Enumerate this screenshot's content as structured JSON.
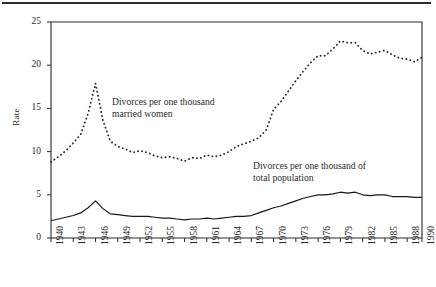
{
  "figure": {
    "ylabel": "Rate",
    "annotations": {
      "married_women": "Divorces per one thousand\nmarried women",
      "total_population": "Divorces per one thousand of\ntotal population"
    },
    "colors": {
      "axis": "#2b2b2b",
      "line": "#1a1a1a",
      "dotted": "#2b2b2b",
      "background": "#ffffff"
    }
  },
  "chart_data": {
    "type": "line",
    "title": "",
    "xlabel": "",
    "ylabel": "Rate",
    "xlim": [
      1940,
      1990
    ],
    "ylim": [
      0,
      25
    ],
    "grid": false,
    "legend_position": "inline-annotations",
    "yticks": [
      0,
      5,
      10,
      15,
      20,
      25
    ],
    "ytick_labels": [
      "0",
      "5",
      "10",
      "15",
      "20",
      "25"
    ],
    "xticks": [
      1940,
      1943,
      1946,
      1949,
      1952,
      1955,
      1958,
      1961,
      1964,
      1967,
      1970,
      1973,
      1976,
      1979,
      1982,
      1985,
      1988,
      1990
    ],
    "xtick_labels": [
      "1940",
      "1943",
      "1946",
      "1949",
      "1952",
      "1955",
      "1958",
      "1961",
      "1964",
      "1967",
      "1970",
      "1973",
      "1976",
      "1979",
      "1982",
      "1985",
      "1988",
      "1990"
    ],
    "x": [
      1940,
      1941,
      1942,
      1943,
      1944,
      1945,
      1946,
      1947,
      1948,
      1949,
      1950,
      1951,
      1952,
      1953,
      1954,
      1955,
      1956,
      1957,
      1958,
      1959,
      1960,
      1961,
      1962,
      1963,
      1964,
      1965,
      1966,
      1967,
      1968,
      1969,
      1970,
      1971,
      1972,
      1973,
      1974,
      1975,
      1976,
      1977,
      1978,
      1979,
      1980,
      1981,
      1982,
      1983,
      1984,
      1985,
      1986,
      1987,
      1988,
      1989,
      1990
    ],
    "series": [
      {
        "name": "Divorces per one thousand married women",
        "style": "dotted",
        "values": [
          8.8,
          9.4,
          10.1,
          11.0,
          12.0,
          14.4,
          17.9,
          13.6,
          11.2,
          10.6,
          10.3,
          9.9,
          10.1,
          9.9,
          9.5,
          9.3,
          9.4,
          9.2,
          8.9,
          9.3,
          9.2,
          9.6,
          9.4,
          9.6,
          10.0,
          10.6,
          10.9,
          11.2,
          11.6,
          12.5,
          14.9,
          15.8,
          17.0,
          18.2,
          19.3,
          20.3,
          21.1,
          21.1,
          21.9,
          22.8,
          22.6,
          22.6,
          21.7,
          21.3,
          21.5,
          21.7,
          21.2,
          20.8,
          20.7,
          20.4,
          20.9
        ]
      },
      {
        "name": "Divorces per one thousand of total population",
        "style": "solid",
        "values": [
          2.0,
          2.2,
          2.4,
          2.6,
          2.9,
          3.5,
          4.3,
          3.4,
          2.8,
          2.7,
          2.6,
          2.5,
          2.5,
          2.5,
          2.4,
          2.3,
          2.3,
          2.2,
          2.1,
          2.2,
          2.2,
          2.3,
          2.2,
          2.3,
          2.4,
          2.5,
          2.5,
          2.6,
          2.9,
          3.2,
          3.5,
          3.7,
          4.0,
          4.3,
          4.6,
          4.8,
          5.0,
          5.0,
          5.1,
          5.3,
          5.2,
          5.3,
          5.0,
          4.9,
          5.0,
          5.0,
          4.8,
          4.8,
          4.8,
          4.7,
          4.7
        ]
      }
    ]
  }
}
